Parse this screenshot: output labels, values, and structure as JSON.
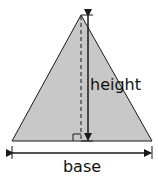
{
  "diagram": {
    "labels": {
      "height": "height",
      "base": "base"
    },
    "colors": {
      "fill": "#c8c8c8",
      "stroke": "#1a1a1a"
    }
  }
}
